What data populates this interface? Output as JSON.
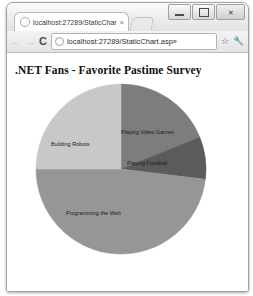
{
  "window": {
    "minimize_label": "Minimize",
    "maximize_label": "Maximize",
    "close_label": "✕"
  },
  "tab": {
    "title": "localhost:27289/StaticChar",
    "close_label": "×",
    "favicon": "globe-icon",
    "new_tab_label": ""
  },
  "toolbar": {
    "back_label": "←",
    "forward_label": "→",
    "reload_label": "C",
    "url": "localhost:27289/StaticChart.asp»",
    "bookmark_label": "☆",
    "menu_label": "🔧"
  },
  "page": {
    "heading": ".NET Fans - Favorite Pastime Survey"
  },
  "chart_data": {
    "type": "pie",
    "title": ".NET Fans - Favorite Pastime Survey",
    "start_angle": 0,
    "direction": "clockwise",
    "legend": "none",
    "labels_inside": true,
    "categories": [
      "Playing Video Games",
      "Playing Foosball",
      "Programming the Web",
      "Building Robots"
    ],
    "values": [
      19,
      8,
      48,
      25
    ],
    "unit": "percent",
    "colors": [
      "#7d7d7d",
      "#5b5b5b",
      "#969696",
      "#c8c8c8"
    ],
    "slices": [
      {
        "label": "Playing Video Games",
        "value": 19,
        "start_deg": 0,
        "end_deg": 68,
        "color": "#7d7d7d",
        "label_x": 86,
        "label_y": 46
      },
      {
        "label": "Playing Foosball",
        "value": 8,
        "start_deg": 68,
        "end_deg": 97,
        "color": "#5b5b5b",
        "label_x": 92,
        "label_y": 77
      },
      {
        "label": "Programming the Web",
        "value": 48,
        "start_deg": 97,
        "end_deg": 270,
        "color": "#969696",
        "label_x": 31,
        "label_y": 127
      },
      {
        "label": "Building Robots",
        "value": 25,
        "start_deg": 270,
        "end_deg": 360,
        "color": "#c8c8c8",
        "label_x": 16,
        "label_y": 58
      }
    ]
  }
}
